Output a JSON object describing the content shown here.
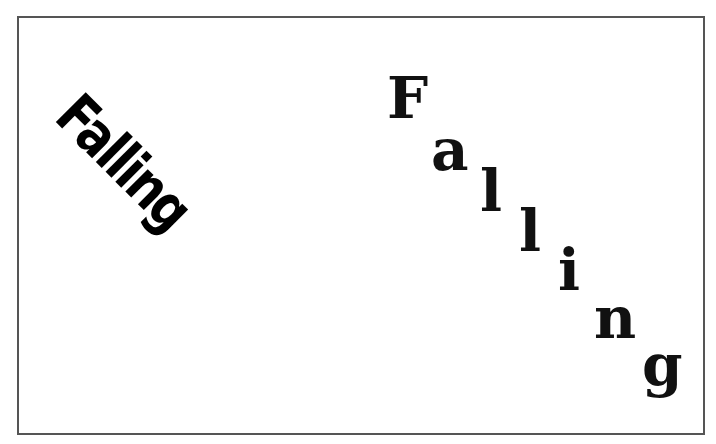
{
  "rotated_text": {
    "word": "Falling",
    "angle_deg": 45
  },
  "falling_letters": [
    {
      "char": "F",
      "left": 387,
      "top": 69
    },
    {
      "char": "a",
      "left": 431,
      "top": 121
    },
    {
      "char": "l",
      "left": 480,
      "top": 162
    },
    {
      "char": "l",
      "left": 519,
      "top": 202
    },
    {
      "char": "i",
      "left": 558,
      "top": 241
    },
    {
      "char": "n",
      "left": 594,
      "top": 289
    },
    {
      "char": "g",
      "left": 642,
      "top": 336
    }
  ],
  "colors": {
    "text": "#000000",
    "border": "#555555",
    "background": "#ffffff"
  }
}
